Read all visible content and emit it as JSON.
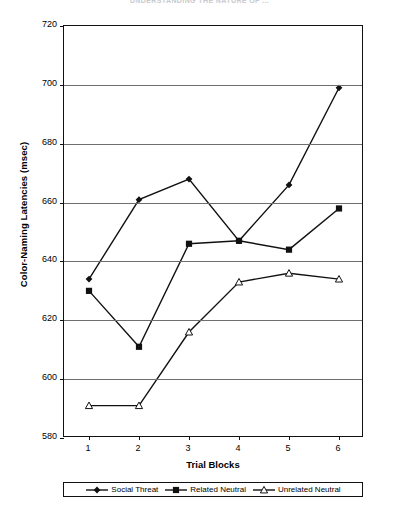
{
  "page_header": "UNDERSTANDING THE NATURE OF ...",
  "chart_data": {
    "type": "line",
    "title": "",
    "xlabel": "Trial Blocks",
    "ylabel": "Color-Naming Latencies (msec)",
    "categories": [
      "1",
      "2",
      "3",
      "4",
      "5",
      "6"
    ],
    "x": [
      1,
      2,
      3,
      4,
      5,
      6
    ],
    "ylim": [
      580,
      720
    ],
    "ytick_step": 20,
    "yticks": [
      580,
      600,
      620,
      640,
      660,
      680,
      700,
      720
    ],
    "grid": "horizontal",
    "legend_position": "bottom",
    "series": [
      {
        "name": "Social Threat",
        "marker": "filled-diamond",
        "color": "#111111",
        "values": [
          634,
          661,
          668,
          647,
          666,
          699
        ]
      },
      {
        "name": "Related Neutral",
        "marker": "filled-square",
        "color": "#111111",
        "values": [
          630,
          611,
          646,
          647,
          644,
          658
        ]
      },
      {
        "name": "Unrelated Neutral",
        "marker": "open-triangle",
        "color": "#111111",
        "values": [
          591,
          591,
          616,
          633,
          636,
          634
        ]
      }
    ]
  }
}
